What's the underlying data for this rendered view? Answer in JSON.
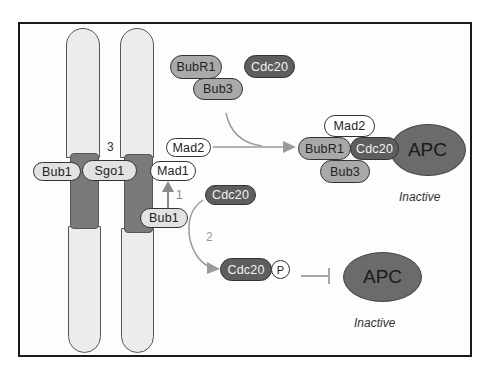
{
  "diagram": {
    "chromosome": {
      "left_kinetochore_proteins": [
        "Bub1",
        "Sgo1"
      ],
      "right_kinetochore_proteins": [
        "Mad1",
        "Bub1"
      ],
      "mad2_label": "Mad2",
      "step3_label": "3"
    },
    "free_proteins": {
      "bubr1": "BubR1",
      "bub3": "Bub3",
      "cdc20_top": "Cdc20",
      "cdc20_mid": "Cdc20"
    },
    "mcc_complex": {
      "mad2": "Mad2",
      "bubr1": "BubR1",
      "cdc20": "Cdc20",
      "bub3": "Bub3",
      "apc": "APC",
      "state": "Inactive"
    },
    "phospho_branch": {
      "cdc20": "Cdc20",
      "phospho": "P",
      "apc": "APC",
      "state": "Inactive"
    },
    "step_labels": {
      "step1": "1",
      "step2": "2"
    },
    "colors": {
      "frame": "#1a1a1a",
      "chromosome_arm": "#ececec",
      "kinetochore": "#7a7a7a",
      "light_protein": "#e2e2e2",
      "mid_protein": "#a9a9a9",
      "dark_protein": "#5e5e5e",
      "apc": "#6b6b6b",
      "arrow": "#9a9a9a"
    }
  }
}
